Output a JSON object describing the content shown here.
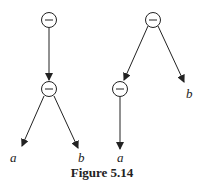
{
  "caption": "Figure 5.14",
  "trees": [
    {
      "nodes": [
        {
          "id": "root",
          "op": "−"
        },
        {
          "id": "child",
          "op": "−"
        }
      ],
      "leaves": [
        {
          "label": "a"
        },
        {
          "label": "b"
        }
      ]
    },
    {
      "nodes": [
        {
          "id": "root",
          "op": "−"
        },
        {
          "id": "child",
          "op": "−"
        }
      ],
      "leaves": [
        {
          "label": "a"
        },
        {
          "label": "b"
        }
      ]
    }
  ]
}
